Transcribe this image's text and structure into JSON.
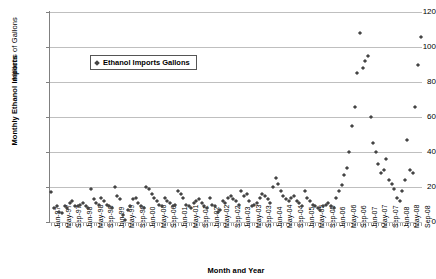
{
  "chart_data": {
    "type": "scatter",
    "title": "",
    "xlabel": "Month and Year",
    "ylabel": "Monthly Ethanol Imports",
    "ylabel2": "Millions of Gallons",
    "ylim": [
      0,
      120
    ],
    "yticks": [
      0,
      20,
      40,
      60,
      80,
      100,
      120
    ],
    "grid": true,
    "legend_position": "inside-top-left",
    "legend": [
      "Ethanol Imports Gallons"
    ],
    "series": [
      {
        "name": "Ethanol Imports Gallons",
        "x": [
          "Jan-97",
          "Feb-97",
          "Mar-97",
          "Apr-97",
          "May-97",
          "Jun-97",
          "Jul-97",
          "Aug-97",
          "Sep-97",
          "Oct-97",
          "Nov-97",
          "Dec-97",
          "Jan-98",
          "Feb-98",
          "Mar-98",
          "Apr-98",
          "May-98",
          "Jun-98",
          "Jul-98",
          "Aug-98",
          "Sep-98",
          "Oct-98",
          "Nov-98",
          "Dec-98",
          "Jan-99",
          "Feb-99",
          "Mar-99",
          "Apr-99",
          "May-99",
          "Jun-99",
          "Jul-99",
          "Aug-99",
          "Sep-99",
          "Oct-99",
          "Nov-99",
          "Dec-99",
          "Jan-00",
          "Feb-00",
          "Mar-00",
          "Apr-00",
          "May-00",
          "Jun-00",
          "Jul-00",
          "Aug-00",
          "Sep-00",
          "Oct-00",
          "Nov-00",
          "Dec-00",
          "Jan-01",
          "Feb-01",
          "Mar-01",
          "Apr-01",
          "May-01",
          "Jun-01",
          "Jul-01",
          "Aug-01",
          "Sep-01",
          "Oct-01",
          "Nov-01",
          "Dec-01",
          "Jan-02",
          "Feb-02",
          "Mar-02",
          "Apr-02",
          "May-02",
          "Jun-02",
          "Jul-02",
          "Aug-02",
          "Sep-02",
          "Oct-02",
          "Nov-02",
          "Dec-02",
          "Jan-03",
          "Feb-03",
          "Mar-03",
          "Apr-03",
          "May-03",
          "Jun-03",
          "Jul-03",
          "Aug-03",
          "Sep-03",
          "Oct-03",
          "Nov-03",
          "Dec-03",
          "Jan-04",
          "Feb-04",
          "Mar-04",
          "Apr-04",
          "May-04",
          "Jun-04",
          "Jul-04",
          "Aug-04",
          "Sep-04",
          "Oct-04",
          "Nov-04",
          "Dec-04",
          "Jan-05",
          "Feb-05",
          "Mar-05",
          "Apr-05",
          "May-05",
          "Jun-05",
          "Jul-05",
          "Aug-05",
          "Sep-05",
          "Oct-05",
          "Nov-05",
          "Dec-05",
          "Jan-06",
          "Feb-06",
          "Mar-06",
          "Apr-06",
          "May-06",
          "Jun-06",
          "Jul-06",
          "Aug-06",
          "Sep-06",
          "Oct-06",
          "Nov-06",
          "Dec-06",
          "Jan-07",
          "Feb-07",
          "Mar-07",
          "Apr-07",
          "May-07",
          "Jun-07",
          "Jul-07",
          "Aug-07",
          "Sep-07",
          "Oct-07",
          "Nov-07",
          "Dec-07",
          "Jan-08",
          "Feb-08",
          "Mar-08",
          "Apr-08",
          "May-08",
          "Jun-08",
          "Jul-08",
          "Aug-08",
          "Sep-08"
        ],
        "values": [
          17,
          8,
          9,
          6,
          5,
          9,
          8,
          11,
          12,
          9,
          9,
          10,
          11,
          9,
          8,
          19,
          13,
          11,
          10,
          14,
          12,
          10,
          9,
          8,
          20,
          15,
          13,
          4,
          1,
          7,
          9,
          13,
          14,
          11,
          9,
          8,
          20,
          19,
          16,
          14,
          12,
          10,
          9,
          14,
          12,
          11,
          9,
          10,
          18,
          16,
          14,
          10,
          9,
          8,
          11,
          12,
          13,
          11,
          9,
          8,
          14,
          10,
          9,
          6,
          7,
          12,
          11,
          14,
          15,
          13,
          12,
          10,
          18,
          15,
          16,
          12,
          9,
          10,
          11,
          14,
          16,
          15,
          13,
          11,
          20,
          25,
          22,
          18,
          15,
          13,
          12,
          14,
          15,
          12,
          11,
          9,
          18,
          14,
          12,
          10,
          9,
          8,
          7,
          9,
          10,
          11,
          9,
          8,
          14,
          18,
          21,
          27,
          31,
          40,
          55,
          66,
          85,
          108,
          88,
          92,
          95,
          60,
          45,
          40,
          33,
          28,
          30,
          36,
          24,
          22,
          19,
          14,
          12,
          18,
          24,
          47,
          30,
          28,
          66,
          90,
          106
        ]
      }
    ]
  },
  "axis": {
    "ylabel_imports": "Monthly Ethanol Imports",
    "ylabel_gallons": "Millions of Gallons",
    "xlabel": "Month and Year",
    "ytick_labels": [
      "120",
      "100",
      "80",
      "60",
      "40",
      "20",
      "0"
    ],
    "xtick_labels": [
      "Jan-97",
      "May-97",
      "Sep-97",
      "Jan-98",
      "May-98",
      "Sep-98",
      "Jan-99",
      "May-99",
      "Sep-99",
      "Jan-00",
      "May-00",
      "Sep-00",
      "Jan-01",
      "May-01",
      "Sep-01",
      "Jan-02",
      "May-02",
      "Sep-02",
      "Jan-03",
      "May-03",
      "Sep-03",
      "Jan-04",
      "May-04",
      "Sep-04",
      "Jan-05",
      "May-05",
      "Sep-05",
      "Jan-06",
      "May-06",
      "Sep-06",
      "Jan-07",
      "May-07",
      "Sep-07",
      "Jan-08",
      "May-08",
      "Sep-08"
    ]
  },
  "legend": {
    "label": "Ethanol Imports Gallons"
  },
  "colors": {
    "marker": "#444444",
    "grid": "#bfbfbf",
    "axis": "#808080"
  }
}
